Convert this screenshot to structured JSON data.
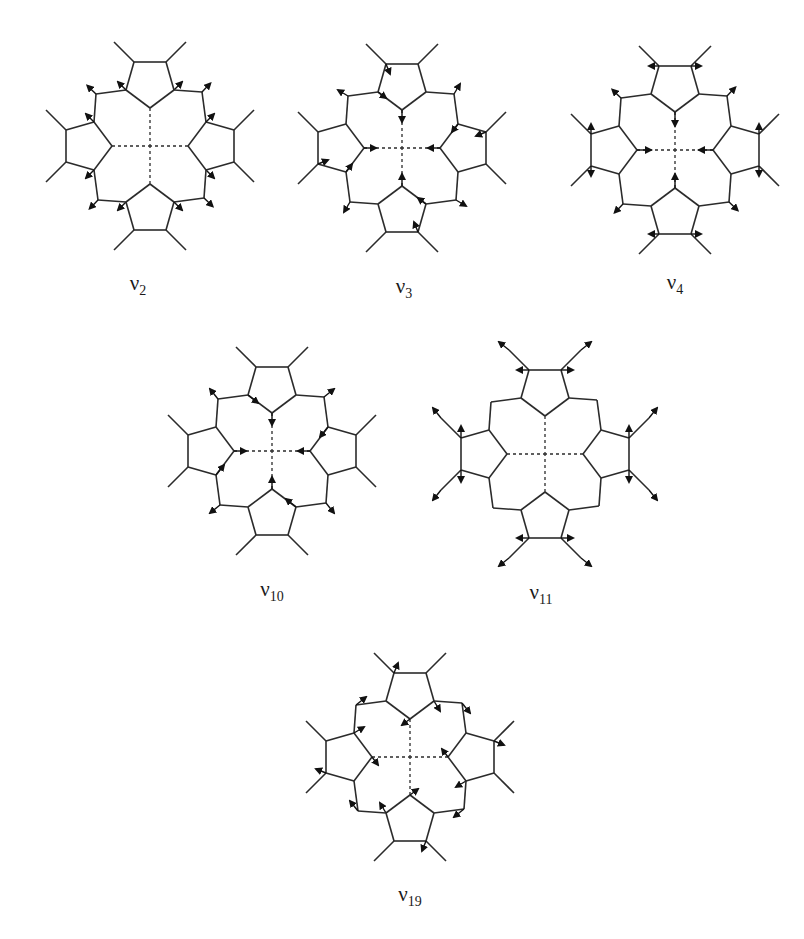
{
  "figure": {
    "type": "porphyrin normal-mode displacement diagrams",
    "line_color": "#2b2b2b",
    "arrow_color": "#111111",
    "modes": [
      {
        "id": "v2",
        "symbol": "ν",
        "subscript": "2",
        "cx": 150,
        "cy": 146,
        "label_x": 138,
        "label_y": 285
      },
      {
        "id": "v3",
        "symbol": "ν",
        "subscript": "3",
        "cx": 402,
        "cy": 148,
        "label_x": 404,
        "label_y": 288
      },
      {
        "id": "v4",
        "symbol": "ν",
        "subscript": "4",
        "cx": 675,
        "cy": 150,
        "label_x": 675,
        "label_y": 284
      },
      {
        "id": "v10",
        "symbol": "ν",
        "subscript": "10",
        "cx": 272,
        "cy": 451,
        "label_x": 272,
        "label_y": 591
      },
      {
        "id": "v11",
        "symbol": "ν",
        "subscript": "11",
        "cx": 545,
        "cy": 454,
        "label_x": 541,
        "label_y": 594
      },
      {
        "id": "v19",
        "symbol": "ν",
        "subscript": "19",
        "cx": 410,
        "cy": 757,
        "label_x": 410,
        "label_y": 896
      }
    ]
  }
}
